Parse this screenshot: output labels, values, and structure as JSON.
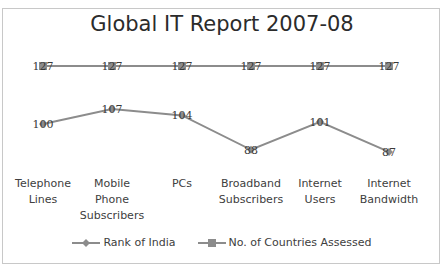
{
  "chart_data": {
    "type": "line",
    "title": "Global IT Report 2007-08",
    "categories": [
      "Telephone\nLines",
      "Mobile\nPhone\nSubscribers",
      "PCs",
      "Broadband\nSubscribers",
      "Internet\nUsers",
      "Internet\nBandwidth"
    ],
    "series": [
      {
        "name": "Rank of India",
        "values": [
          100,
          107,
          104,
          88,
          101,
          87
        ],
        "marker": "diamond",
        "color": "#8c8c8c"
      },
      {
        "name": "No. of Countries Assessed",
        "values": [
          127,
          127,
          127,
          127,
          127,
          127
        ],
        "marker": "square",
        "color": "#8c8c8c"
      }
    ],
    "xlabel": "",
    "ylabel": "",
    "grid": false,
    "data_labels": true,
    "legend_position": "bottom"
  },
  "title": "Global IT Report 2007-08",
  "legend": [
    {
      "label": "Rank of India",
      "marker": "diamond"
    },
    {
      "label": "No. of Countries Assessed",
      "marker": "square"
    }
  ]
}
